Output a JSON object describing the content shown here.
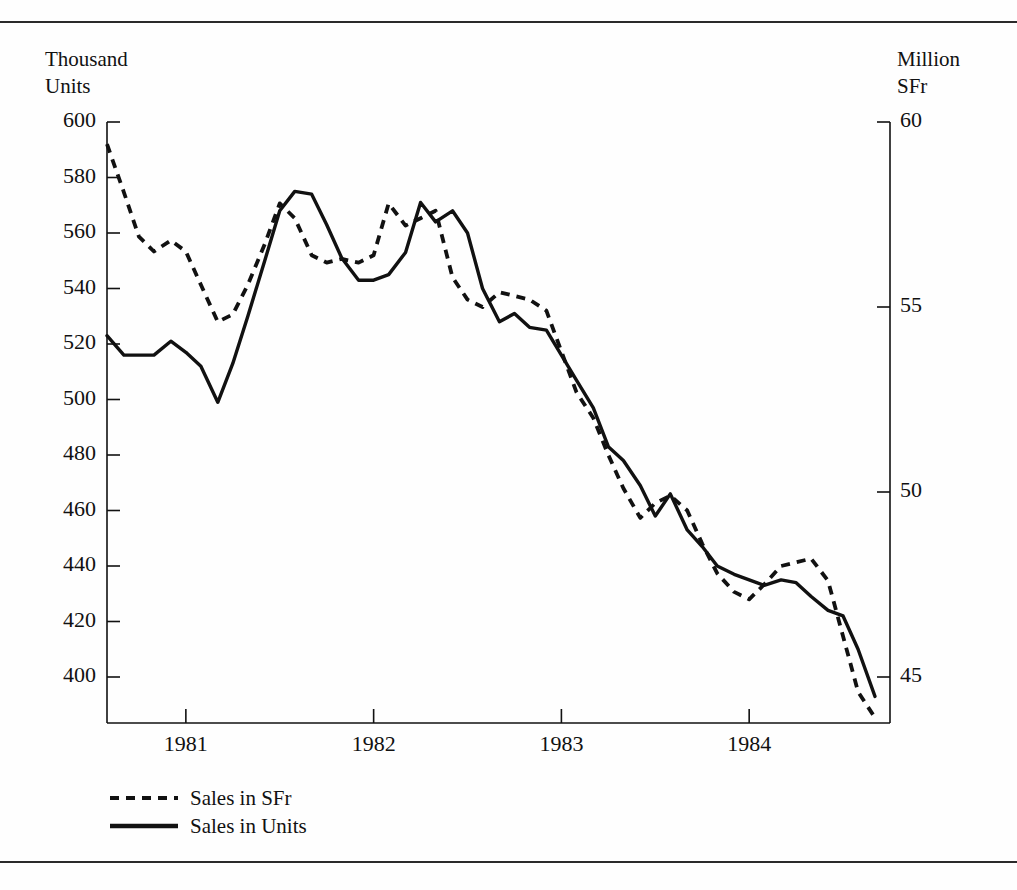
{
  "figure": {
    "left_axis_caption": "Thousand\nUnits",
    "right_axis_caption": "Million\nSFr",
    "line_color": "#111111"
  },
  "legend": {
    "position": "below-axis-left",
    "entries": [
      {
        "label": "Sales in SFr",
        "style": "dashed",
        "icon": "dashed-line-icon"
      },
      {
        "label": "Sales in Units",
        "style": "solid",
        "icon": "solid-line-icon"
      }
    ]
  },
  "chart_data": {
    "type": "line",
    "title": "",
    "subtitle": "",
    "xlabel": "",
    "ylabel": "Thousand Units",
    "y2label": "Million SFr",
    "grid": false,
    "legend_position": "bottom-left",
    "xlim": [
      1980.58,
      1984.75
    ],
    "x_tick_labels": [
      "1981",
      "1982",
      "1983",
      "1984"
    ],
    "x_tick_values": [
      1981,
      1982,
      1983,
      1984
    ],
    "ylim": [
      392,
      600
    ],
    "y_tick_labels": [
      "600",
      "580",
      "560",
      "540",
      "520",
      "500",
      "480",
      "460",
      "440",
      "420",
      "400"
    ],
    "y_tick_values": [
      600,
      580,
      560,
      540,
      520,
      500,
      480,
      460,
      440,
      420,
      400
    ],
    "y2lim": [
      43.9,
      60
    ],
    "y2_tick_labels": [
      "60",
      "55",
      "50",
      "45"
    ],
    "y2_tick_values": [
      60,
      55,
      50,
      45
    ],
    "x": [
      1980.58,
      1980.67,
      1980.75,
      1980.83,
      1980.92,
      1981.0,
      1981.08,
      1981.17,
      1981.25,
      1981.33,
      1981.42,
      1981.5,
      1981.58,
      1981.67,
      1981.75,
      1981.83,
      1981.92,
      1982.0,
      1982.08,
      1982.17,
      1982.25,
      1982.33,
      1982.42,
      1982.5,
      1982.58,
      1982.67,
      1982.75,
      1982.83,
      1982.92,
      1983.0,
      1983.08,
      1983.17,
      1983.25,
      1983.33,
      1983.42,
      1983.5,
      1983.58,
      1983.67,
      1983.75,
      1983.83,
      1983.92,
      1984.0,
      1984.08,
      1984.17,
      1984.25,
      1984.33,
      1984.42,
      1984.5,
      1984.58,
      1984.67
    ],
    "series": [
      {
        "name": "Sales in SFr",
        "style": "dashed",
        "axis": "right",
        "units": "Million SFr",
        "values": [
          59.4,
          58.1,
          56.9,
          56.5,
          56.8,
          56.5,
          55.6,
          54.6,
          54.8,
          55.6,
          56.7,
          57.8,
          57.4,
          56.4,
          56.2,
          56.3,
          56.2,
          56.4,
          57.8,
          57.2,
          57.4,
          57.6,
          55.8,
          55.2,
          55.0,
          55.4,
          55.3,
          55.2,
          54.9,
          53.8,
          52.7,
          52.0,
          51.0,
          50.1,
          49.3,
          49.7,
          49.9,
          49.5,
          48.6,
          47.8,
          47.3,
          47.1,
          47.5,
          48.0,
          48.1,
          48.2,
          47.6,
          46.1,
          44.6,
          43.9
        ],
        "values_thousand_units_equivalent": [
          594,
          578,
          562,
          558,
          559,
          556,
          544,
          531,
          534,
          544,
          558,
          573,
          568,
          556,
          533,
          535,
          533,
          536,
          554,
          547,
          550,
          553,
          529,
          521,
          518,
          524,
          523,
          521,
          517,
          503,
          489,
          480,
          467,
          456,
          446,
          451,
          453,
          448,
          437,
          426,
          421,
          419,
          424,
          430,
          431,
          432,
          425,
          406,
          387,
          380
        ]
      },
      {
        "name": "Sales in Units",
        "style": "solid",
        "axis": "left",
        "units": "Thousand Units",
        "values": [
          523,
          516,
          516,
          516,
          521,
          517,
          512,
          499,
          513,
          530,
          550,
          568,
          575,
          574,
          563,
          551,
          543,
          543,
          545,
          553,
          571,
          564,
          568,
          560,
          540,
          528,
          531,
          526,
          525,
          516,
          507,
          497,
          483,
          478,
          469,
          458,
          466,
          453,
          447,
          440,
          437,
          435,
          433,
          435,
          434,
          429,
          424,
          422,
          410,
          393
        ]
      }
    ]
  }
}
